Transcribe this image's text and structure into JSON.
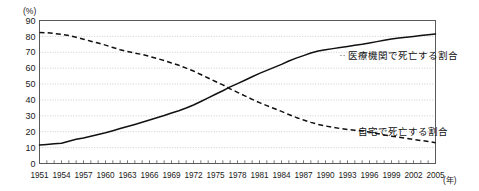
{
  "chart_data": {
    "type": "line",
    "title": "",
    "subtitle": "",
    "xlabel": "(年)",
    "ylabel": "(%)",
    "xlim": [
      1951,
      2005
    ],
    "ylim": [
      0,
      90
    ],
    "y_ticks": [
      "0",
      "10",
      "20",
      "30",
      "40",
      "50",
      "60",
      "70",
      "80",
      "90"
    ],
    "y_tick_values": [
      0,
      10,
      20,
      30,
      40,
      50,
      60,
      70,
      80,
      90
    ],
    "x_tick_labels": [
      "1951",
      "1954",
      "1957",
      "1960",
      "1963",
      "1966",
      "1969",
      "1972",
      "1975",
      "1978",
      "1981",
      "1984",
      "1987",
      "1990",
      "1993",
      "1996",
      "1999",
      "2002",
      "2005"
    ],
    "x_tick_values": [
      1951,
      1954,
      1957,
      1960,
      1963,
      1966,
      1969,
      1972,
      1975,
      1978,
      1981,
      1984,
      1987,
      1990,
      1993,
      1996,
      1999,
      2002,
      2005
    ],
    "x_minor_step": 1,
    "grid": true,
    "grid_axis": "y",
    "legend_position": "inline-annotation",
    "series": [
      {
        "name": "医療機関で死亡する割合",
        "style": "solid",
        "color": "#111111",
        "annotation": "医療機関で死亡する割合",
        "annotation_value": 68,
        "annotation_year": 1992,
        "x": [
          1951,
          1952,
          1953,
          1954,
          1955,
          1956,
          1957,
          1958,
          1959,
          1960,
          1961,
          1962,
          1963,
          1964,
          1965,
          1966,
          1967,
          1968,
          1969,
          1970,
          1971,
          1972,
          1973,
          1974,
          1975,
          1976,
          1977,
          1978,
          1979,
          1980,
          1981,
          1982,
          1983,
          1984,
          1985,
          1986,
          1987,
          1988,
          1989,
          1990,
          1991,
          1992,
          1993,
          1994,
          1995,
          1996,
          1997,
          1998,
          1999,
          2000,
          2001,
          2002,
          2003,
          2004,
          2005
        ],
        "values": [
          11.7,
          12.0,
          12.4,
          12.8,
          14.0,
          15.2,
          16.1,
          17.2,
          18.3,
          19.3,
          20.6,
          22.0,
          23.3,
          24.6,
          26.0,
          27.4,
          28.8,
          30.2,
          31.8,
          33.2,
          34.9,
          36.8,
          39.0,
          41.3,
          43.6,
          45.8,
          48.2,
          50.3,
          52.4,
          54.6,
          56.7,
          58.6,
          60.5,
          62.4,
          64.5,
          66.3,
          67.9,
          69.5,
          70.8,
          71.6,
          72.3,
          73.0,
          73.7,
          74.4,
          75.0,
          75.8,
          76.7,
          77.5,
          78.4,
          79.0,
          79.5,
          80.0,
          80.5,
          81.0,
          81.5
        ]
      },
      {
        "name": "自宅で死亡する割合",
        "style": "dashed",
        "color": "#111111",
        "annotation": "自宅で死亡する割合",
        "annotation_value": 20,
        "annotation_year": 1994,
        "x": [
          1951,
          1952,
          1953,
          1954,
          1955,
          1956,
          1957,
          1958,
          1959,
          1960,
          1961,
          1962,
          1963,
          1964,
          1965,
          1966,
          1967,
          1968,
          1969,
          1970,
          1971,
          1972,
          1973,
          1974,
          1975,
          1976,
          1977,
          1978,
          1979,
          1980,
          1981,
          1982,
          1983,
          1984,
          1985,
          1986,
          1987,
          1988,
          1989,
          1990,
          1991,
          1992,
          1993,
          1994,
          1995,
          1996,
          1997,
          1998,
          1999,
          2000,
          2001,
          2002,
          2003,
          2004,
          2005
        ],
        "values": [
          82.5,
          82.3,
          81.8,
          81.3,
          80.5,
          79.4,
          78.2,
          77.0,
          75.8,
          74.5,
          73.0,
          71.6,
          70.5,
          69.5,
          68.6,
          67.4,
          66.1,
          64.8,
          63.3,
          61.8,
          60.0,
          58.2,
          56.0,
          53.8,
          51.6,
          49.5,
          47.0,
          44.8,
          42.6,
          40.4,
          38.3,
          36.4,
          34.6,
          32.8,
          30.8,
          29.0,
          27.4,
          25.9,
          24.6,
          23.6,
          22.8,
          22.0,
          21.4,
          21.0,
          20.5,
          19.8,
          18.9,
          18.0,
          17.2,
          16.5,
          15.9,
          15.2,
          14.5,
          13.8,
          13.1
        ]
      }
    ]
  },
  "axes": {
    "y_unit_label": "(%)",
    "x_unit_label": "(年)"
  }
}
